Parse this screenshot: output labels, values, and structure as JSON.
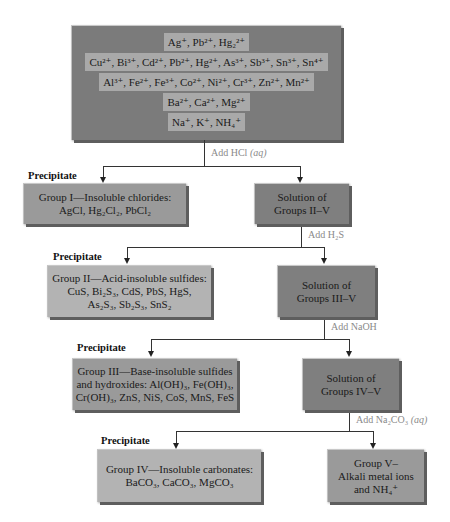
{
  "top_box": {
    "rows": [
      "Ag⁺, Pb²⁺, Hg₂²⁺",
      "Cu²⁺, Bi³⁺, Cd²⁺, Pb²⁺, Hg²⁺, As³⁺, Sb³⁺, Sn³⁺, Sn⁴⁺",
      "Al³⁺, Fe²⁺, Fe³⁺, Co²⁺, Ni²⁺, Cr³⁺, Zn²⁺, Mn²⁺",
      "Ba²⁺, Ca²⁺, Mg²⁺",
      "Na⁺, K⁺, NH₄⁺"
    ]
  },
  "steps": [
    {
      "reagent": "Add HCl",
      "reagent_state": "(aq)",
      "precipitate_label": "Precipitate",
      "precipitate": [
        "Group I—Insoluble chlorides:",
        "AgCl, Hg₂Cl₂, PbCl₂"
      ],
      "solution": [
        "Solution of",
        "Groups II–V"
      ]
    },
    {
      "reagent": "Add H₂S",
      "reagent_state": "",
      "precipitate_label": "Precipitate",
      "precipitate": [
        "Group II—Acid-insoluble sulfides:",
        "CuS, Bi₂S₃, CdS, PbS, HgS,",
        "As₂S₃, Sb₂S₃, SnS₂"
      ],
      "solution": [
        "Solution of",
        "Groups III–V"
      ]
    },
    {
      "reagent": "Add NaOH",
      "reagent_state": "",
      "precipitate_label": "Precipitate",
      "precipitate": [
        "Group III—Base-insoluble sulfides",
        "and hydroxides: Al(OH)₃, Fe(OH)₃,",
        "Cr(OH)₃, ZnS, NiS, CoS, MnS, FeS"
      ],
      "solution": [
        "Solution of",
        "Groups IV–V"
      ]
    },
    {
      "reagent": "Add Na₂CO₃",
      "reagent_state": "(aq)",
      "precipitate_label": "Precipitate",
      "precipitate": [
        "Group IV—Insoluble carbonates:",
        "BaCO₃, CaCO₃, MgCO₃"
      ],
      "solution": [
        "Group V–",
        "Alkali metal ions",
        "and NH₄⁺"
      ]
    }
  ],
  "colors": {
    "top_box": "#7b7b7b",
    "top_band": "#a9a9a9",
    "dark_box": "#7f7f7f",
    "light_box": "#b3b3b3",
    "reagent_text": "#8a8a8a"
  }
}
